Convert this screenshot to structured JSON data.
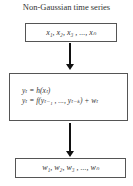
{
  "diagram": {
    "title": "Non-Gaussian time series",
    "nodes": [
      {
        "id": "input",
        "label": "x₁, x₂, x₃ , ..., x_N",
        "display": "x₁, x₂, x₃ , ..., xₙ"
      },
      {
        "id": "model",
        "lines": [
          "yₜ = h(xₜ)",
          "yₜ = f(yₜ₋₁ , ..., yₜ₋ₖ) + wₜ"
        ]
      },
      {
        "id": "output",
        "label": "w₁, w₂, w₃ , ..., w_N",
        "display": "w₁, w₂, w₃ , ..., wₙ"
      }
    ],
    "edges": [
      {
        "from": "input",
        "to": "model"
      },
      {
        "from": "model",
        "to": "output"
      }
    ],
    "colors": {
      "box_border": "#555555",
      "arrow": "#111111",
      "text": "#333333"
    }
  }
}
